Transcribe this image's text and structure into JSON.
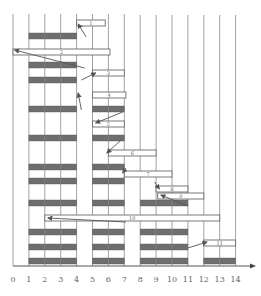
{
  "diagram": {
    "type": "gantt-like packing diagram",
    "axis": {
      "ticks": [
        "0",
        "1",
        "2",
        "3",
        "4",
        "5",
        "6",
        "7",
        "8",
        "9",
        "10",
        "11",
        "12",
        "13",
        "14"
      ],
      "origin_x": 13,
      "unit_px": 15.9,
      "axis_y": 266,
      "grid_top": 14
    },
    "colors": {
      "grid": "#8a8a8a",
      "filled": "#6e6e6e",
      "box_border": "#6a6a6a",
      "arrow": "#555555",
      "text": "#666666"
    },
    "columns": [
      {
        "name": "column-1-4",
        "x0": 1,
        "x1": 4
      },
      {
        "name": "column-5-7",
        "x0": 5,
        "x1": 7
      },
      {
        "name": "column-8-11",
        "x0": 8,
        "x1": 11
      },
      {
        "name": "column-12-14",
        "x0": 12,
        "x1": 14
      }
    ],
    "filled_bars": [
      {
        "x0": 1,
        "x1": 4,
        "y": 33,
        "h": 6
      },
      {
        "x0": 1,
        "x1": 4,
        "y": 62,
        "h": 6
      },
      {
        "x0": 1,
        "x1": 4,
        "y": 77,
        "h": 6
      },
      {
        "x0": 1,
        "x1": 4,
        "y": 106,
        "h": 6
      },
      {
        "x0": 1,
        "x1": 4,
        "y": 135,
        "h": 6
      },
      {
        "x0": 1,
        "x1": 4,
        "y": 164,
        "h": 6
      },
      {
        "x0": 1,
        "x1": 4,
        "y": 178,
        "h": 6
      },
      {
        "x0": 1,
        "x1": 4,
        "y": 200,
        "h": 6
      },
      {
        "x0": 1,
        "x1": 4,
        "y": 229,
        "h": 6
      },
      {
        "x0": 1,
        "x1": 4,
        "y": 244,
        "h": 6
      },
      {
        "x0": 1,
        "x1": 4,
        "y": 258,
        "h": 6
      },
      {
        "x0": 5,
        "x1": 7,
        "y": 106,
        "h": 6
      },
      {
        "x0": 5,
        "x1": 7,
        "y": 135,
        "h": 6
      },
      {
        "x0": 5,
        "x1": 7,
        "y": 164,
        "h": 6
      },
      {
        "x0": 5,
        "x1": 7,
        "y": 178,
        "h": 6
      },
      {
        "x0": 5,
        "x1": 7,
        "y": 200,
        "h": 6
      },
      {
        "x0": 5,
        "x1": 7,
        "y": 229,
        "h": 6
      },
      {
        "x0": 5,
        "x1": 7,
        "y": 244,
        "h": 6
      },
      {
        "x0": 5,
        "x1": 7,
        "y": 258,
        "h": 6
      },
      {
        "x0": 8,
        "x1": 11,
        "y": 200,
        "h": 6
      },
      {
        "x0": 8,
        "x1": 11,
        "y": 229,
        "h": 6
      },
      {
        "x0": 8,
        "x1": 11,
        "y": 244,
        "h": 6
      },
      {
        "x0": 8,
        "x1": 11,
        "y": 258,
        "h": 6
      },
      {
        "x0": 12,
        "x1": 14,
        "y": 258,
        "h": 6
      }
    ],
    "boxes": [
      {
        "label": "1",
        "x0": 4,
        "x1": 5.8,
        "y": 20,
        "h": 6
      },
      {
        "label": "2",
        "x0": 0,
        "x1": 6.1,
        "y": 49,
        "h": 6
      },
      {
        "label": "3",
        "x0": 5,
        "x1": 7,
        "y": 70,
        "h": 6
      },
      {
        "label": "4",
        "x0": 5,
        "x1": 7.1,
        "y": 92,
        "h": 6
      },
      {
        "label": "5",
        "x0": 5,
        "x1": 7,
        "y": 121,
        "h": 6
      },
      {
        "label": "6",
        "x0": 6,
        "x1": 9,
        "y": 150,
        "h": 6
      },
      {
        "label": "7",
        "x0": 7,
        "x1": 10,
        "y": 171,
        "h": 6
      },
      {
        "label": "8",
        "x0": 9,
        "x1": 11,
        "y": 186,
        "h": 6
      },
      {
        "label": "9",
        "x0": 9.1,
        "x1": 12,
        "y": 193,
        "h": 6
      },
      {
        "label": "10",
        "x0": 2,
        "x1": 13,
        "y": 215,
        "h": 6
      },
      {
        "label": "11",
        "x0": 12,
        "x1": 14,
        "y": 240,
        "h": 6
      }
    ],
    "arrows": [
      {
        "from": [
          4.6,
          37
        ],
        "to": [
          4.1,
          24
        ]
      },
      {
        "from": [
          4.5,
          68
        ],
        "to": [
          0.1,
          50
        ]
      },
      {
        "from": [
          4.3,
          80
        ],
        "to": [
          5.2,
          73
        ]
      },
      {
        "from": [
          4.3,
          110
        ],
        "to": [
          4.1,
          93
        ]
      },
      {
        "from": [
          6.9,
          112
        ],
        "to": [
          5.2,
          123
        ]
      },
      {
        "from": [
          6.8,
          140
        ],
        "to": [
          5.9,
          153
        ]
      },
      {
        "from": [
          7.1,
          168
        ],
        "to": [
          6.9,
          173
        ]
      },
      {
        "from": [
          8.9,
          182
        ],
        "to": [
          9.2,
          189
        ]
      },
      {
        "from": [
          11,
          206
        ],
        "to": [
          9.3,
          195
        ]
      },
      {
        "from": [
          7.1,
          222
        ],
        "to": [
          2.2,
          218
        ]
      },
      {
        "from": [
          11,
          248
        ],
        "to": [
          12.2,
          242
        ]
      }
    ]
  }
}
